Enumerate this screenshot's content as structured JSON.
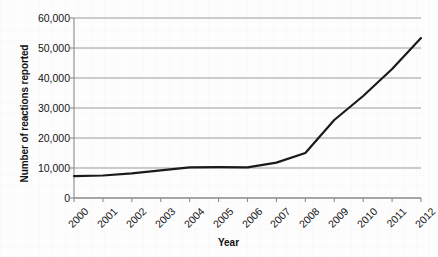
{
  "chart_data": {
    "type": "line",
    "title": "",
    "xlabel": "Year",
    "ylabel": "Number of reactions reported",
    "categories": [
      "2000",
      "2001",
      "2002",
      "2003",
      "2004",
      "2005",
      "2006",
      "2007",
      "2008",
      "2009",
      "2010",
      "2011",
      "2012"
    ],
    "values": [
      7300,
      7500,
      8200,
      9200,
      10200,
      10300,
      10200,
      11800,
      15000,
      26000,
      34000,
      43000,
      53300
    ],
    "series": [
      {
        "name": "Number of reactions reported",
        "values": [
          7300,
          7500,
          8200,
          9200,
          10200,
          10300,
          10200,
          11800,
          15000,
          26000,
          34000,
          43000,
          53300
        ]
      }
    ],
    "ylim": [
      0,
      60000
    ],
    "yticks": [
      0,
      10000,
      20000,
      30000,
      40000,
      50000,
      60000
    ],
    "ytick_labels": [
      "0",
      "10,000",
      "20,000",
      "30,000",
      "40,000",
      "50,000",
      "60,000"
    ],
    "grid": true,
    "legend": "none",
    "line_color": "#1a1a1a",
    "grid_color": "#9a9a9a",
    "axis_color": "#808080",
    "background_color": "#fdfdfd"
  }
}
